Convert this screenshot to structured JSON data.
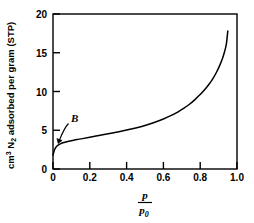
{
  "chart_data": {
    "type": "line",
    "title": "",
    "xlabel": "p/p0",
    "xlabel_numerator": "p",
    "xlabel_denominator": "p",
    "xlabel_denominator_sub": "0",
    "ylabel": "cm3 N2 adsorbed per gram (STP)",
    "ylabel_parts": {
      "cm": "cm",
      "cm_sup": "3",
      "n": " N",
      "n_sub": "2",
      "rest": " adsorbed per gram (STP)"
    },
    "xlim": [
      0,
      1.0
    ],
    "ylim": [
      0,
      20
    ],
    "xticks": [
      "0",
      "0.2",
      "0.4",
      "0.6",
      "0.8",
      "1.0"
    ],
    "xtick_values": [
      0,
      0.2,
      0.4,
      0.6,
      0.8,
      1.0
    ],
    "yticks": [
      "0",
      "5",
      "10",
      "15",
      "20"
    ],
    "ytick_values": [
      0,
      5,
      10,
      15,
      20
    ],
    "grid": false,
    "legend": "none",
    "line_color": "#000000",
    "frame_color": "#000000",
    "series": [
      {
        "name": "nitrogen adsorption isotherm",
        "x": [
          0.0,
          0.004,
          0.008,
          0.013,
          0.019,
          0.026,
          0.034,
          0.043,
          0.054,
          0.068,
          0.085,
          0.105,
          0.13,
          0.16,
          0.2,
          0.25,
          0.3,
          0.35,
          0.4,
          0.45,
          0.5,
          0.55,
          0.6,
          0.64,
          0.68,
          0.71,
          0.74,
          0.77,
          0.8,
          0.825,
          0.85,
          0.87,
          0.89,
          0.905,
          0.92,
          0.932,
          0.942,
          0.95
        ],
        "y": [
          1.8,
          2.15,
          2.45,
          2.7,
          2.9,
          3.05,
          3.18,
          3.28,
          3.38,
          3.48,
          3.58,
          3.68,
          3.8,
          3.92,
          4.1,
          4.32,
          4.55,
          4.78,
          5.02,
          5.3,
          5.62,
          6.0,
          6.45,
          6.88,
          7.38,
          7.82,
          8.32,
          8.92,
          9.62,
          10.25,
          11.0,
          11.7,
          12.55,
          13.3,
          14.2,
          15.1,
          16.1,
          17.8
        ]
      }
    ],
    "annotations": [
      {
        "label": "B",
        "label_x": 0.105,
        "label_y": 6.6,
        "arrow_tip_x": 0.028,
        "arrow_tip_y": 3.25,
        "description": "curved arrow from B label to knee of isotherm"
      }
    ]
  }
}
